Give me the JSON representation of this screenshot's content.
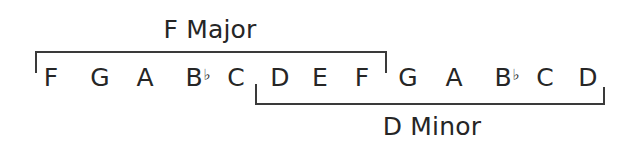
{
  "diagram": {
    "top_label": "F Major",
    "bottom_label": "D Minor",
    "notes": [
      {
        "name": "F",
        "acc": "",
        "x": 51
      },
      {
        "name": "G",
        "acc": "",
        "x": 100
      },
      {
        "name": "A",
        "acc": "",
        "x": 145
      },
      {
        "name": "B",
        "acc": "♭",
        "x": 194
      },
      {
        "name": "C",
        "acc": "",
        "x": 236
      },
      {
        "name": "D",
        "acc": "",
        "x": 280
      },
      {
        "name": "E",
        "acc": "",
        "x": 320
      },
      {
        "name": "F",
        "acc": "",
        "x": 362
      },
      {
        "name": "G",
        "acc": "",
        "x": 408
      },
      {
        "name": "A",
        "acc": "",
        "x": 454
      },
      {
        "name": "B",
        "acc": "♭",
        "x": 503
      },
      {
        "name": "C",
        "acc": "",
        "x": 545
      },
      {
        "name": "D",
        "acc": "",
        "x": 588
      }
    ],
    "top_bracket": {
      "from_note": "F",
      "to_note": "F",
      "x1": 35,
      "x2": 386,
      "y": 52
    },
    "bottom_bracket": {
      "from_note": "D",
      "to_note": "D",
      "x1": 255,
      "x2": 604,
      "y": 104
    }
  }
}
